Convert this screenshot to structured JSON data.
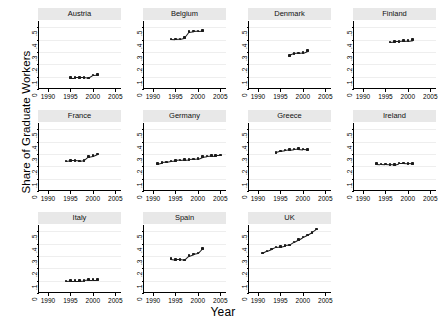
{
  "chart_data": {
    "type": "scatter",
    "title": "",
    "xlabel": "Year",
    "ylabel": "Share of Graduate Workers",
    "grid": true,
    "legend": "none",
    "layout": {
      "rows": 3,
      "cols": 4,
      "note": "small-multiple panels by country"
    },
    "xlim": [
      1988,
      2006.5
    ],
    "ylim": [
      0,
      0.55
    ],
    "xticks": [
      1990,
      1995,
      2000,
      2005
    ],
    "xticklabels": [
      "1990",
      "1995",
      "2000",
      "2005"
    ],
    "yticks": [
      0,
      0.1,
      0.2,
      0.3,
      0.4,
      0.5
    ],
    "yticklabels": [
      "0",
      ".1",
      ".2",
      ".3",
      ".4",
      ".5"
    ],
    "panels": [
      {
        "label": "Austria",
        "x": [
          1995,
          1996,
          1997,
          1998,
          1999,
          2000,
          2001
        ],
        "y": [
          0.093,
          0.094,
          0.094,
          0.095,
          0.09,
          0.113,
          0.115
        ]
      },
      {
        "label": "Belgium",
        "x": [
          1994,
          1995,
          1996,
          1997,
          1998,
          1999,
          2000,
          2001
        ],
        "y": [
          0.405,
          0.403,
          0.405,
          0.415,
          0.463,
          0.468,
          0.47,
          0.472
        ]
      },
      {
        "label": "Denmark",
        "x": [
          1997,
          1998,
          1999,
          2000,
          2001
        ],
        "y": [
          0.272,
          0.288,
          0.292,
          0.295,
          0.31
        ]
      },
      {
        "label": "Finland",
        "x": [
          1996,
          1997,
          1998,
          1999,
          2000,
          2001
        ],
        "y": [
          0.381,
          0.385,
          0.386,
          0.39,
          0.392,
          0.398
        ]
      },
      {
        "label": "France",
        "x": [
          1994,
          1995,
          1996,
          1997,
          1998,
          1999,
          2000,
          2001
        ],
        "y": [
          0.242,
          0.247,
          0.247,
          0.243,
          0.248,
          0.278,
          0.285,
          0.3
        ]
      },
      {
        "label": "Germany",
        "x": [
          1991,
          1992,
          1993,
          1994,
          1995,
          1996,
          1997,
          1998,
          1999,
          2000,
          2001,
          2002,
          2003,
          2004,
          2005
        ],
        "y": [
          0.222,
          0.232,
          0.235,
          0.243,
          0.247,
          0.25,
          0.253,
          0.256,
          0.258,
          0.262,
          0.278,
          0.283,
          0.287,
          0.289,
          0.29
        ]
      },
      {
        "label": "Greece",
        "x": [
          1994,
          1995,
          1996,
          1997,
          1998,
          1999,
          2000,
          2001
        ],
        "y": [
          0.313,
          0.325,
          0.33,
          0.335,
          0.34,
          0.343,
          0.34,
          0.338
        ]
      },
      {
        "label": "Ireland",
        "x": [
          1993,
          1994,
          1995,
          1996,
          1997,
          1998,
          1999,
          2000,
          2001
        ],
        "y": [
          0.222,
          0.22,
          0.218,
          0.216,
          0.213,
          0.225,
          0.226,
          0.224,
          0.222
        ]
      },
      {
        "label": "Italy",
        "x": [
          1994,
          1995,
          1996,
          1997,
          1998,
          1999,
          2000,
          2001
        ],
        "y": [
          0.098,
          0.1,
          0.101,
          0.101,
          0.103,
          0.107,
          0.108,
          0.108
        ]
      },
      {
        "label": "Spain",
        "x": [
          1994,
          1995,
          1996,
          1997,
          1998,
          1999,
          2000,
          2001
        ],
        "y": [
          0.278,
          0.272,
          0.273,
          0.268,
          0.302,
          0.315,
          0.322,
          0.36
        ]
      },
      {
        "label": "UK",
        "x": [
          1991,
          1992,
          1993,
          1994,
          1995,
          1996,
          1997,
          1998,
          1999,
          2000,
          2001,
          2002,
          2003
        ],
        "y": [
          0.322,
          0.34,
          0.355,
          0.372,
          0.375,
          0.385,
          0.388,
          0.412,
          0.432,
          0.452,
          0.47,
          0.49,
          0.517
        ]
      }
    ]
  }
}
